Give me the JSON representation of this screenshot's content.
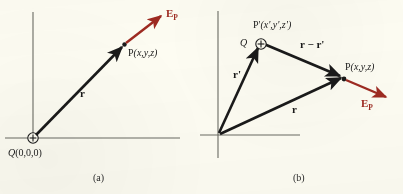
{
  "figure": {
    "background_color": "#fdfcf2",
    "vector_color": "#1a1a1a",
    "field_color": "#9e2a21",
    "axis_color": "#5a5a52"
  },
  "panel_a": {
    "caption": "(a)",
    "charge_label": "Q",
    "charge_coords": "(0,0,0)",
    "charge_sign": "+",
    "point_label": "P",
    "point_coords": "(x,y,z)",
    "position_vector_label": "r",
    "field_label": "E",
    "field_subscript": "P"
  },
  "panel_b": {
    "caption": "(b)",
    "charge_label": "Q",
    "charge_sign": "+",
    "source_point_label": "P'",
    "source_point_coords": "(x',y',z')",
    "field_point_label": "P",
    "field_point_coords": "(x,y,z)",
    "source_vector_label": "r'",
    "field_vector_label": "r",
    "separation_vector_label": "r − r'",
    "field_label": "E",
    "field_subscript": "P"
  }
}
